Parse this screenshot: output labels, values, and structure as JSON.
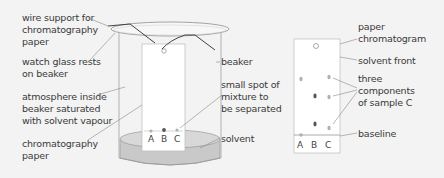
{
  "left_diagram": {
    "labels": {
      "wire_support": "wire support for\nchromatography\npaper",
      "watch_glass": "watch glass rests\non beaker",
      "atmosphere": "atmosphere inside\nbeaker saturated\nwith solvent vapour",
      "chromatography_paper": "chromatography\npaper",
      "beaker": "beaker",
      "small_spot": "small spot of\nmixture to\nbe separated",
      "solvent": "solvent"
    },
    "spots": [
      "A",
      "B",
      "C"
    ]
  },
  "right_diagram": {
    "labels": {
      "paper_chromatogram": "paper\nchromatogram",
      "solvent_front": "solvent front",
      "three_components": "three\ncomponents\nof sample C",
      "baseline": "baseline"
    },
    "lanes": [
      "A",
      "B",
      "C"
    ]
  },
  "colors": {
    "background": "#f3f3f3",
    "solvent": "#c9c9c9",
    "paper": "#ffffff",
    "spot_dark": "#555555",
    "spot_light": "#b0b0b0"
  }
}
